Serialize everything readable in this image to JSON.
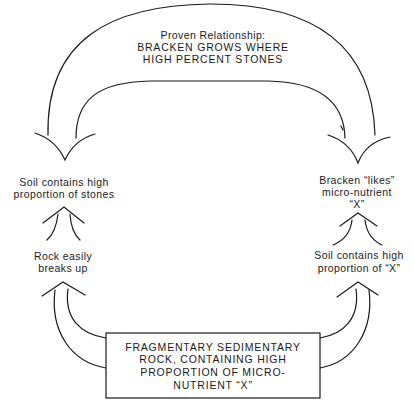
{
  "diagram": {
    "top_relationship": {
      "lines": [
        "Proven Relationship:",
        "BRACKEN GROWS WHERE",
        "HIGH PERCENT STONES"
      ]
    },
    "left_top_node": {
      "lines": [
        "Soil contains high",
        "proportion of stones"
      ]
    },
    "left_middle_node": {
      "lines": [
        "Rock easily",
        "breaks up"
      ]
    },
    "right_top_node": {
      "lines": [
        "Bracken “likes”",
        "micro-nutrient",
        "“X”"
      ]
    },
    "right_middle_node": {
      "lines": [
        "Soil contains high",
        "proportion of “X”"
      ]
    },
    "source_box": {
      "lines": [
        "FRAGMENTARY SEDIMENTARY",
        "ROCK, CONTAINING HIGH",
        "PROPORTION OF MICRO-",
        "NUTRIENT “X”"
      ]
    },
    "arrows": [
      {
        "from": "right_top_node",
        "to": "left_top_node",
        "style": "large-curved-double-line",
        "label": "top_relationship"
      },
      {
        "from": "left_middle_node",
        "to": "left_top_node",
        "style": "small-double-line"
      },
      {
        "from": "right_middle_node",
        "to": "right_top_node",
        "style": "small-double-line"
      },
      {
        "from": "source_box",
        "to": "left_middle_node",
        "style": "curved-double-line"
      },
      {
        "from": "source_box",
        "to": "right_middle_node",
        "style": "curved-double-line"
      }
    ],
    "colors": {
      "ink": "#1a1a1a",
      "background": "#ffffff"
    }
  }
}
